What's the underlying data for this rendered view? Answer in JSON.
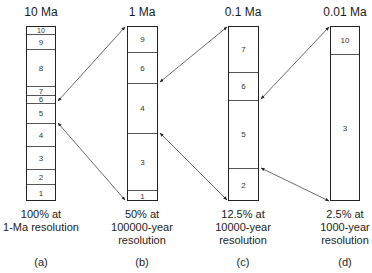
{
  "columns": [
    {
      "id": "a",
      "title": "10 Ma",
      "caption": [
        "100% at",
        "1-Ma resolution"
      ],
      "letter": "(a)",
      "segments_top_to_bottom": [
        {
          "label": "10",
          "top": 0,
          "height": 7
        },
        {
          "label": "9",
          "top": 7,
          "height": 15
        },
        {
          "label": "8",
          "top": 22,
          "height": 37
        },
        {
          "label": "7",
          "top": 59,
          "height": 9
        },
        {
          "label": "6",
          "top": 68,
          "height": 8
        },
        {
          "label": "5",
          "top": 76,
          "height": 20
        },
        {
          "label": "4",
          "top": 96,
          "height": 23
        },
        {
          "label": "3",
          "top": 119,
          "height": 23
        },
        {
          "label": "2",
          "top": 142,
          "height": 15
        },
        {
          "label": "1",
          "top": 157,
          "height": 18
        }
      ]
    },
    {
      "id": "b",
      "title": "1 Ma",
      "caption": [
        "50% at",
        "100000-year",
        "resolution"
      ],
      "letter": "(b)",
      "segments_top_to_bottom": [
        {
          "label": "9",
          "top": 0,
          "height": 25
        },
        {
          "label": "6",
          "top": 25,
          "height": 31
        },
        {
          "label": "4",
          "top": 56,
          "height": 50
        },
        {
          "label": "3",
          "top": 106,
          "height": 57
        },
        {
          "label": "1",
          "top": 163,
          "height": 12
        }
      ]
    },
    {
      "id": "c",
      "title": "0.1 Ma",
      "caption": [
        "12.5% at",
        "10000-year",
        "resolution"
      ],
      "letter": "(c)",
      "segments_top_to_bottom": [
        {
          "label": "7",
          "top": 0,
          "height": 45
        },
        {
          "label": "6",
          "top": 45,
          "height": 28
        },
        {
          "label": "5",
          "top": 73,
          "height": 68
        },
        {
          "label": "2",
          "top": 141,
          "height": 34
        }
      ]
    },
    {
      "id": "d",
      "title": "0.01 Ma",
      "caption": [
        "2.5% at",
        "1000-year",
        "resolution"
      ],
      "letter": "(d)",
      "segments_top_to_bottom": [
        {
          "label": "10",
          "top": 0,
          "height": 27
        },
        {
          "label": "3",
          "top": 27,
          "height": 148
        }
      ]
    }
  ],
  "arrows": [
    {
      "from": "a: top of segment 6",
      "to": "b: top of column"
    },
    {
      "from": "a: top of segment 4",
      "to": "b: bottom of column"
    },
    {
      "from": "b: top of segment 4",
      "to": "c: top of column"
    },
    {
      "from": "b: top of segment 1",
      "to": "c: bottom of column"
    },
    {
      "from": "c: top of segment 5",
      "to": "d: top of column"
    },
    {
      "from": "c: top of segment 2",
      "to": "d: bottom of column"
    }
  ]
}
